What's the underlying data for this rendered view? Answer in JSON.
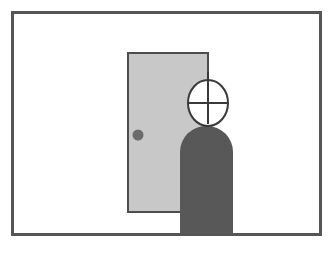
{
  "figure": {
    "caption": "",
    "canvas": {
      "width": 333,
      "height": 259,
      "background": "#ffffff"
    }
  },
  "colors": {
    "background": "#ffffff",
    "frame_stroke": "#555555",
    "door_fill": "#c8c8c8",
    "door_stroke": "#4d4d4d",
    "doorknob_fill": "#6b6b6b",
    "body_fill": "#585858",
    "head_fill": "#ffffff",
    "head_stroke": "#3a3a3a",
    "crosshair_stroke": "#3a3a3a",
    "floor_line": "#555555"
  },
  "elements": {
    "frame": {
      "name": "picture-frame",
      "x": 11,
      "y": 11,
      "width": 311,
      "height": 225,
      "stroke_width": 3
    },
    "door": {
      "name": "door",
      "x": 128,
      "y": 53,
      "width": 80,
      "height": 159,
      "stroke_width": 2
    },
    "doorknob": {
      "name": "doorknob",
      "cx": 138,
      "cy": 135,
      "r": 5.5
    },
    "body": {
      "name": "person-body",
      "x": 180,
      "y": 126,
      "width": 53,
      "height": 110,
      "corner_radius": 26
    },
    "head": {
      "name": "person-head",
      "cx": 208,
      "cy": 103,
      "rx": 20,
      "ry": 23,
      "stroke_width": 2
    },
    "crosshair": {
      "name": "head-crosshair",
      "vertical": {
        "x": 208,
        "y1": 72,
        "y2": 124
      },
      "horizontal": {
        "y": 103,
        "x1": 189,
        "x2": 227
      },
      "stroke_width": 2
    }
  },
  "labels": {
    "scene_description": "Person standing in front of a door",
    "door_label": "door",
    "person_label": "person",
    "knob_label": "doorknob",
    "head_mark_label": "crosshair"
  }
}
